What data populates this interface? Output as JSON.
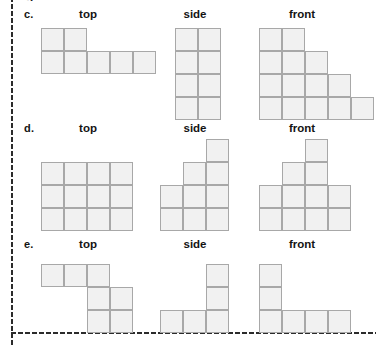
{
  "page": {
    "clipped_top_text": "g",
    "background_color": "#ffffff",
    "border_style": "dotted",
    "border_color": "#2b2b2b"
  },
  "style": {
    "cell_fill": "#f1f1f1",
    "cell_border": "#a8a8a8",
    "cell_size_px": 23
  },
  "labels": {
    "top": "top",
    "side": "side",
    "front": "front"
  },
  "rows": [
    {
      "letter": "c.",
      "views": {
        "top": {
          "cols": 5,
          "rows": 2,
          "cells": [
            [
              0,
              0
            ],
            [
              1,
              0
            ],
            [
              0,
              1
            ],
            [
              1,
              1
            ],
            [
              2,
              1
            ],
            [
              3,
              1
            ],
            [
              4,
              1
            ]
          ]
        },
        "side": {
          "cols": 2,
          "rows": 4,
          "cells": [
            [
              0,
              0
            ],
            [
              1,
              0
            ],
            [
              0,
              1
            ],
            [
              1,
              1
            ],
            [
              0,
              2
            ],
            [
              1,
              2
            ],
            [
              0,
              3
            ],
            [
              1,
              3
            ]
          ]
        },
        "front": {
          "cols": 5,
          "rows": 4,
          "cells": [
            [
              0,
              0
            ],
            [
              1,
              0
            ],
            [
              0,
              1
            ],
            [
              1,
              1
            ],
            [
              2,
              1
            ],
            [
              0,
              2
            ],
            [
              1,
              2
            ],
            [
              2,
              2
            ],
            [
              3,
              2
            ],
            [
              0,
              3
            ],
            [
              1,
              3
            ],
            [
              2,
              3
            ],
            [
              3,
              3
            ],
            [
              4,
              3
            ]
          ]
        }
      }
    },
    {
      "letter": "d.",
      "views": {
        "top": {
          "cols": 4,
          "rows": 3,
          "cells": [
            [
              0,
              0
            ],
            [
              1,
              0
            ],
            [
              2,
              0
            ],
            [
              3,
              0
            ],
            [
              0,
              1
            ],
            [
              1,
              1
            ],
            [
              2,
              1
            ],
            [
              3,
              1
            ],
            [
              0,
              2
            ],
            [
              1,
              2
            ],
            [
              2,
              2
            ],
            [
              3,
              2
            ]
          ]
        },
        "side": {
          "cols": 3,
          "rows": 4,
          "cells": [
            [
              2,
              0
            ],
            [
              1,
              1
            ],
            [
              2,
              1
            ],
            [
              0,
              2
            ],
            [
              1,
              2
            ],
            [
              2,
              2
            ],
            [
              0,
              3
            ],
            [
              1,
              3
            ],
            [
              2,
              3
            ]
          ]
        },
        "front": {
          "cols": 4,
          "rows": 4,
          "cells": [
            [
              2,
              0
            ],
            [
              1,
              1
            ],
            [
              2,
              1
            ],
            [
              0,
              2
            ],
            [
              1,
              2
            ],
            [
              2,
              2
            ],
            [
              3,
              2
            ],
            [
              0,
              3
            ],
            [
              1,
              3
            ],
            [
              2,
              3
            ],
            [
              3,
              3
            ]
          ]
        }
      }
    },
    {
      "letter": "e.",
      "views": {
        "top": {
          "cols": 4,
          "rows": 3,
          "cells": [
            [
              0,
              0
            ],
            [
              1,
              0
            ],
            [
              2,
              0
            ],
            [
              2,
              1
            ],
            [
              3,
              1
            ],
            [
              2,
              2
            ],
            [
              3,
              2
            ]
          ]
        },
        "side": {
          "cols": 3,
          "rows": 3,
          "cells": [
            [
              2,
              0
            ],
            [
              2,
              1
            ],
            [
              0,
              2
            ],
            [
              1,
              2
            ],
            [
              2,
              2
            ]
          ]
        },
        "front": {
          "cols": 4,
          "rows": 3,
          "cells": [
            [
              0,
              0
            ],
            [
              0,
              1
            ],
            [
              0,
              2
            ],
            [
              1,
              2
            ],
            [
              2,
              2
            ],
            [
              3,
              2
            ]
          ]
        }
      }
    }
  ]
}
